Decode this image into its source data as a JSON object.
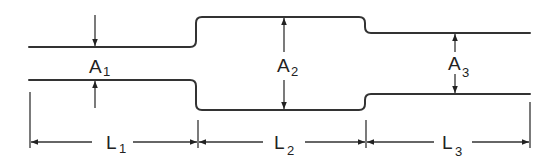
{
  "diagram": {
    "sections": [
      {
        "area_label": "A",
        "area_sub": "1",
        "length_label": "L",
        "length_sub": "1"
      },
      {
        "area_label": "A",
        "area_sub": "2",
        "length_label": "L",
        "length_sub": "2"
      },
      {
        "area_label": "A",
        "area_sub": "3",
        "length_label": "L",
        "length_sub": "3"
      }
    ],
    "colors": {
      "line": "#333333",
      "background": "#ffffff"
    }
  }
}
